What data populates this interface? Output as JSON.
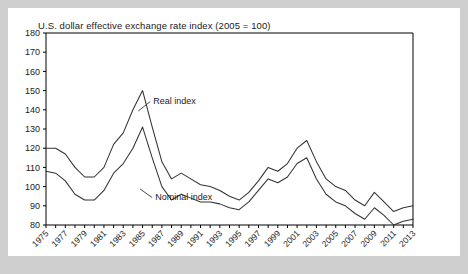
{
  "chart_data": {
    "type": "line",
    "title": "U.S. dollar effective exchange rate index (2005 = 100)",
    "xlabel": "",
    "ylabel": "",
    "ylim": [
      80,
      180
    ],
    "xlim": [
      1975,
      2013
    ],
    "ytick_step": 10,
    "yticks": [
      80,
      90,
      100,
      110,
      120,
      130,
      140,
      150,
      160,
      170,
      180
    ],
    "xticks_labeled": [
      1975,
      1977,
      1979,
      1981,
      1983,
      1985,
      1987,
      1989,
      1991,
      1993,
      1995,
      1997,
      1999,
      2001,
      2003,
      2005,
      2007,
      2009,
      2011,
      2013
    ],
    "xtick_every": 1,
    "grid": false,
    "legend_position": "inline-annotation",
    "x": [
      1975,
      1976,
      1977,
      1978,
      1979,
      1980,
      1981,
      1982,
      1983,
      1984,
      1985,
      1986,
      1987,
      1988,
      1989,
      1990,
      1991,
      1992,
      1993,
      1994,
      1995,
      1996,
      1997,
      1998,
      1999,
      2000,
      2001,
      2002,
      2003,
      2004,
      2005,
      2006,
      2007,
      2008,
      2009,
      2010,
      2011,
      2012,
      2013
    ],
    "series": [
      {
        "name": "Real index",
        "color": "#333333",
        "values": [
          120,
          120,
          117,
          110,
          105,
          105,
          110,
          122,
          128,
          140,
          150,
          131,
          113,
          104,
          107,
          104,
          101,
          100,
          98,
          95,
          93,
          97,
          103,
          110,
          108,
          112,
          120,
          124,
          113,
          104,
          100,
          98,
          93,
          90,
          97,
          92,
          87,
          89,
          90
        ]
      },
      {
        "name": "Nominal index",
        "color": "#333333",
        "values": [
          108,
          107,
          103,
          96,
          93,
          93,
          98,
          107,
          112,
          120,
          131,
          115,
          100,
          93,
          96,
          94,
          92,
          92,
          91,
          89,
          88,
          92,
          98,
          104,
          102,
          105,
          112,
          115,
          104,
          96,
          92,
          90,
          86,
          83,
          89,
          85,
          80,
          82,
          83
        ]
      }
    ],
    "annotations": [
      {
        "text": "Real index",
        "x": 1986.0,
        "y": 143
      },
      {
        "text": "Nominal index",
        "x": 1986.2,
        "y": 93
      }
    ]
  },
  "colors": {
    "page_background": "#cfcfcf",
    "card_background": "#ffffff",
    "axis": "#000000",
    "line": "#333333",
    "text": "#1a1a1a"
  }
}
